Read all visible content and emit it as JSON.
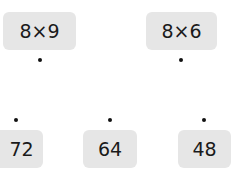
{
  "expressions": [
    {
      "label": "8×9"
    },
    {
      "label": "8×6"
    }
  ],
  "answers": [
    {
      "label": "72"
    },
    {
      "label": "64"
    },
    {
      "label": "48"
    }
  ]
}
